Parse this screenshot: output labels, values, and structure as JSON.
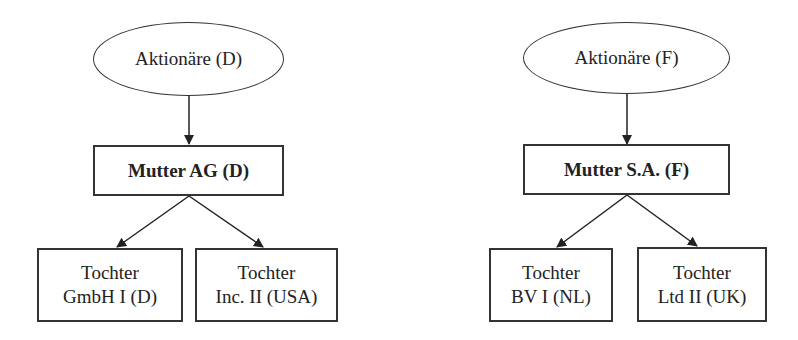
{
  "diagrams": [
    {
      "shareholders": "Aktionäre (D)",
      "parent": "Mutter AG (D)",
      "subsidiaries": [
        {
          "line1": "Tochter",
          "line2": "GmbH I (D)"
        },
        {
          "line1": "Tochter",
          "line2": "Inc. II (USA)"
        }
      ]
    },
    {
      "shareholders": "Aktionäre (F)",
      "parent": "Mutter S.A. (F)",
      "subsidiaries": [
        {
          "line1": "Tochter",
          "line2": "BV I (NL)"
        },
        {
          "line1": "Tochter",
          "line2": "Ltd II (UK)"
        }
      ]
    }
  ]
}
